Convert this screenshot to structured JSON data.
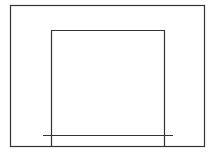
{
  "diagram": {
    "stroke_color": "#333333",
    "background": "#ffffff",
    "shapes": {
      "outer_frame": {
        "x1": 10.5,
        "y1": 5.5,
        "x2": 204.5,
        "y2": 146.5
      },
      "inner_opening": {
        "left": 51.5,
        "right": 164.5,
        "top": 30.5,
        "bottom": 146.5
      },
      "base_line": {
        "x1": 43,
        "x2": 173,
        "y": 135.5
      }
    }
  }
}
